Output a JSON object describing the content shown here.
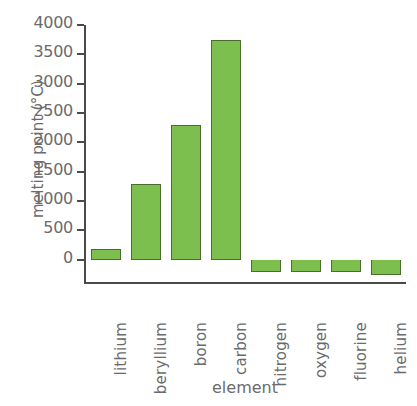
{
  "chart_data": {
    "type": "bar",
    "title": "",
    "xlabel": "element",
    "ylabel": "melting point (°C)",
    "categories": [
      "lithium",
      "beryllium",
      "boron",
      "carbon",
      "nitrogen",
      "oxygen",
      "fluorine",
      "helium"
    ],
    "values": [
      180,
      1285,
      2300,
      3750,
      -210,
      -220,
      -220,
      -270
    ],
    "ylim": [
      -400,
      4000
    ],
    "yticks": [
      0,
      500,
      1000,
      1500,
      2000,
      2500,
      3000,
      3500,
      4000
    ],
    "ytick_labels": [
      "0",
      "500",
      "1000",
      "1500",
      "2000",
      "2500",
      "3000",
      "3500",
      "4000"
    ],
    "grid": false,
    "legend": false,
    "bar_color": "#7dbf4e",
    "bar_edge_color": "#4c6b2f",
    "axis_color": "#4a4a4a",
    "text_color": "#6b6b6b",
    "background": "#ffffff"
  }
}
